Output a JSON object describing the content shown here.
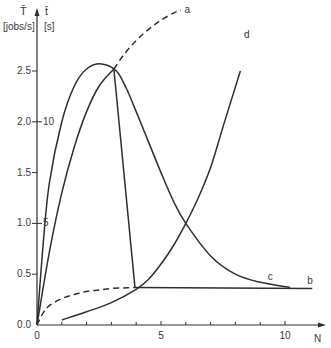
{
  "chart_data": {
    "type": "line",
    "title": "",
    "xlabel": "N",
    "ylabel_left": {
      "symbol": "T̄",
      "unit": "[jobs/s]"
    },
    "ylabel_right": {
      "symbol": "t̄",
      "unit": "[s]"
    },
    "xlim": [
      0,
      11.5
    ],
    "ylim": [
      0,
      3.1
    ],
    "grid": false,
    "legend": "inline curve labels",
    "x_ticks": [
      0,
      1,
      2,
      3,
      4,
      5,
      6,
      7,
      8,
      9,
      10
    ],
    "x_tick_labels": [
      {
        "value": 0,
        "label": "0"
      },
      {
        "value": 5,
        "label": "5"
      },
      {
        "value": 10,
        "label": "10"
      }
    ],
    "y_ticks_left": [
      {
        "value": 0.0,
        "label": "0.0"
      },
      {
        "value": 0.5,
        "label": "0.5"
      },
      {
        "value": 1.0,
        "label": "1.0"
      },
      {
        "value": 1.5,
        "label": "1.5"
      },
      {
        "value": 2.0,
        "label": "2.0"
      },
      {
        "value": 2.5,
        "label": "2.5"
      }
    ],
    "y_ticks_right": [
      {
        "value": 1.0,
        "label": "5"
      },
      {
        "value": 2.0,
        "label": "10"
      }
    ],
    "series": [
      {
        "name": "a",
        "style": "solid-then-dashed",
        "solid": {
          "x": [
            0,
            0.5,
            1,
            1.5,
            2,
            2.5,
            3.1
          ],
          "y": [
            0,
            0.72,
            1.3,
            1.75,
            2.1,
            2.35,
            2.52
          ]
        },
        "dashed": {
          "x": [
            3.1,
            3.5,
            4,
            4.5,
            5,
            5.5,
            5.8
          ],
          "y": [
            2.52,
            2.66,
            2.8,
            2.91,
            3.0,
            3.07,
            3.1
          ]
        },
        "label_at": [
          5.95,
          3.1
        ]
      },
      {
        "name": "b",
        "style": "dashed-then-solid",
        "dashed": {
          "x": [
            0,
            0.25,
            0.5,
            1,
            1.5,
            2,
            2.5,
            3,
            3.5,
            3.95
          ],
          "y": [
            0,
            0.12,
            0.19,
            0.26,
            0.3,
            0.33,
            0.345,
            0.36,
            0.365,
            0.37
          ]
        },
        "solid": {
          "x": [
            3.95,
            11.1
          ],
          "y": [
            0.37,
            0.36
          ]
        },
        "label_at": [
          10.9,
          0.43
        ]
      },
      {
        "name": "c",
        "style": "solid",
        "x": [
          0,
          0.25,
          0.5,
          1,
          1.5,
          2,
          2.6,
          3.2,
          3.6,
          4,
          4.5,
          5,
          5.5,
          6,
          7,
          8,
          9,
          10.2
        ],
        "y": [
          0,
          0.8,
          1.4,
          2.0,
          2.35,
          2.52,
          2.57,
          2.5,
          2.33,
          2.1,
          1.8,
          1.5,
          1.22,
          1.0,
          0.68,
          0.5,
          0.42,
          0.37
        ],
        "label_at": [
          9.3,
          0.47
        ]
      },
      {
        "name": "d",
        "style": "solid",
        "x": [
          1,
          2,
          3,
          4,
          4.5,
          5,
          5.5,
          6,
          6.5,
          7,
          7.5,
          8.2
        ],
        "y": [
          0.05,
          0.13,
          0.22,
          0.35,
          0.45,
          0.6,
          0.78,
          1.0,
          1.25,
          1.55,
          1.95,
          2.5
        ],
        "label_at": [
          8.35,
          2.85
        ]
      },
      {
        "name": "drop-line",
        "style": "solid",
        "x": [
          3.1,
          3.95
        ],
        "y": [
          2.52,
          0.37
        ]
      }
    ]
  },
  "axes": {
    "left_symbol": "T̄",
    "left_unit": "[jobs/s]",
    "right_symbol": "t̄",
    "right_unit": "[s]",
    "x_label": "N"
  }
}
